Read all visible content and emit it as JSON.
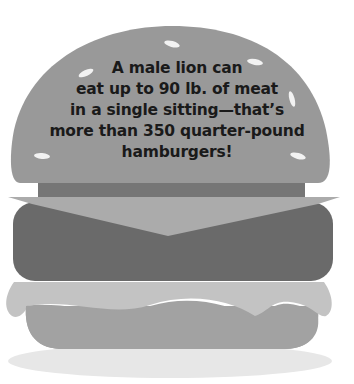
{
  "illustration": {
    "subject": "hamburger",
    "fact_lines": [
      "A male lion can",
      "eat up to 90 lb. of meat",
      "in a single sitting—that’s",
      "more than 350 quarter-pound",
      "hamburgers!"
    ],
    "colors": {
      "background": "#ffffff",
      "top_bun": "#999999",
      "sesame_seed": "#f2f2f2",
      "top_strip": "#767676",
      "cheese": "#ababab",
      "patty": "#6a6a6a",
      "lettuce": "#c3c3c3",
      "bottom_bun": "#a2a2a2",
      "shadow": "#e7e7e7",
      "text": "#1a1a1a"
    }
  }
}
